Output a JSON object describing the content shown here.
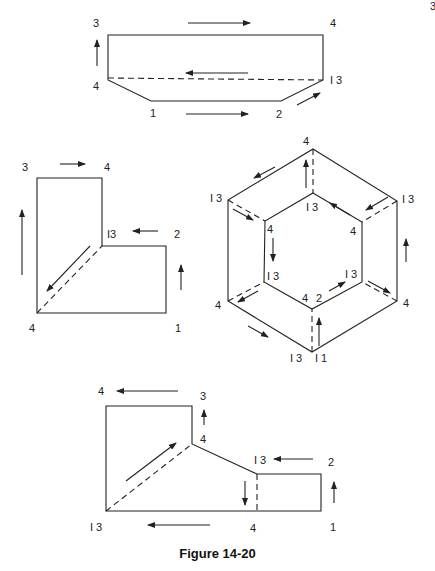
{
  "page": {
    "page_number_fragment": "3",
    "caption": "Figure 14-20"
  },
  "figures": {
    "top": {
      "labels": {
        "top_left": "3",
        "top_right": "4",
        "mid_left": "4",
        "mid_right": "I 3",
        "bottom_left": "1",
        "bottom_right": "2"
      }
    },
    "left": {
      "labels": {
        "top_left": "3",
        "top_right": "4",
        "inner_corner": "I3",
        "step_right": "2",
        "bottom_left": "4",
        "bottom_right": "1"
      }
    },
    "hexagon": {
      "labels": {
        "outer_top": "4",
        "outer_upper_left": "I 3",
        "outer_upper_right": "I 3",
        "outer_lower_left": "4",
        "outer_lower_right": "4",
        "outer_bottom_left": "I 3",
        "outer_bottom_right": "I 1",
        "inner_top": "I 3",
        "inner_upper_left": "4",
        "inner_upper_right": "4",
        "inner_lower_left": "I 3",
        "inner_lower_right": "I 3",
        "inner_bottom_a": "4",
        "inner_bottom_b": "2"
      }
    },
    "bottom": {
      "labels": {
        "top_left": "4",
        "top_right": "3",
        "mid_vertex": "4",
        "step_label": "I 3",
        "step_right": "2",
        "bottom_left": "I 3",
        "bottom_mid": "4",
        "bottom_right": "1"
      }
    }
  }
}
